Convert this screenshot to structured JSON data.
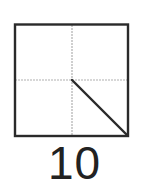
{
  "practice_grid": {
    "type": "tian-zi-ge",
    "border_color": "#2a2a2a",
    "guide_color": "#aaaaaa",
    "stroke_color": "#2a2a2a",
    "stroke": {
      "name": "dian (dot/diagonal stroke)",
      "from": "center",
      "to": "bottom-right corner"
    }
  },
  "label": {
    "text": "10"
  }
}
